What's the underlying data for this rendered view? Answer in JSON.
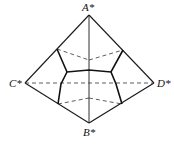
{
  "diagram": {
    "labels": {
      "top": "A*",
      "bottom": "B*",
      "left": "C*",
      "right": "D*"
    },
    "stroke_color": "#1a1a1a",
    "background": "#ffffff"
  }
}
